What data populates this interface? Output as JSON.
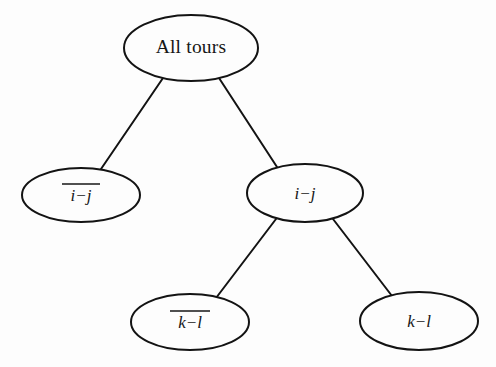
{
  "diagram": {
    "type": "tree",
    "background_color": "#fdfdfd",
    "line_color": "#131313",
    "text_color": "#161616",
    "nodes": [
      {
        "id": "root",
        "label": "All tours",
        "style": "upright",
        "overline": false,
        "cx": 191,
        "cy": 48,
        "rx": 67,
        "ry": 33
      },
      {
        "id": "not-ij",
        "label": "i−j",
        "style": "italic",
        "overline": true,
        "cx": 81,
        "cy": 195,
        "rx": 59,
        "ry": 27
      },
      {
        "id": "ij",
        "label": "i−j",
        "style": "italic",
        "overline": false,
        "cx": 305,
        "cy": 193,
        "rx": 58,
        "ry": 29
      },
      {
        "id": "not-kl",
        "label": "k−l",
        "style": "italic",
        "overline": true,
        "cx": 190,
        "cy": 322,
        "rx": 59,
        "ry": 28
      },
      {
        "id": "kl",
        "label": "k−l",
        "style": "italic",
        "overline": false,
        "cx": 419,
        "cy": 321,
        "rx": 59,
        "ry": 29
      }
    ],
    "edges": [
      {
        "id": "root-to-not-ij",
        "from": "root",
        "to": "not-ij",
        "x1": 163,
        "y1": 78,
        "x2": 101,
        "y2": 169
      },
      {
        "id": "root-to-ij",
        "from": "root",
        "to": "ij",
        "x1": 219,
        "y1": 78,
        "x2": 277,
        "y2": 167
      },
      {
        "id": "ij-to-not-kl",
        "from": "ij",
        "to": "not-kl",
        "x1": 276,
        "y1": 219,
        "x2": 216,
        "y2": 298
      },
      {
        "id": "ij-to-kl",
        "from": "ij",
        "to": "kl",
        "x1": 333,
        "y1": 219,
        "x2": 392,
        "y2": 296
      }
    ]
  }
}
